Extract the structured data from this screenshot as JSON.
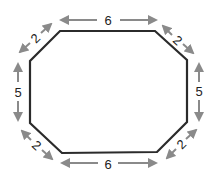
{
  "diagram": {
    "shape": "octagon",
    "colors": {
      "outline": "#2b2b2b",
      "arrow": "#8a8a8a",
      "label": "#222222",
      "background": "#ffffff"
    },
    "sides": {
      "top": "6",
      "top_right": "2",
      "right": "5",
      "bottom_right": "2",
      "bottom": "6",
      "bottom_left": "2",
      "left": "5",
      "top_left": "2"
    }
  }
}
